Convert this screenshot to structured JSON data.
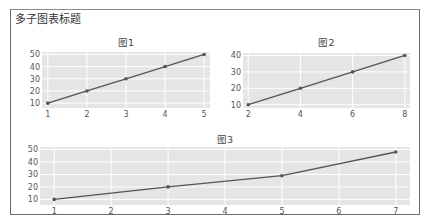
{
  "main_title": "多子图表标题",
  "colors": {
    "plot_bg": "#e5e5e5",
    "grid": "#ffffff",
    "line": "#555555",
    "marker": "#555555",
    "frame": "#6e6e6e"
  },
  "chart_data": [
    {
      "type": "line",
      "title": "图1",
      "x": [
        1,
        2,
        3,
        4,
        5
      ],
      "y": [
        10,
        20,
        30,
        40,
        50
      ],
      "xticks": [
        "1",
        "2",
        "3",
        "4",
        "5"
      ],
      "yticks": [
        "10",
        "20",
        "30",
        "40",
        "50"
      ],
      "xlabel": "",
      "ylabel": "",
      "grid": true,
      "markers": true
    },
    {
      "type": "line",
      "title": "图2",
      "x": [
        2,
        4,
        6,
        8
      ],
      "y": [
        10,
        20,
        30,
        40
      ],
      "xticks": [
        "2",
        "4",
        "6",
        "8"
      ],
      "yticks": [
        "10",
        "20",
        "30",
        "40"
      ],
      "xlabel": "",
      "ylabel": "",
      "grid": true,
      "markers": true
    },
    {
      "type": "line",
      "title": "图3",
      "x": [
        1,
        3,
        5,
        7
      ],
      "y": [
        10,
        20,
        29,
        48
      ],
      "xticks": [
        "1",
        "2",
        "3",
        "4",
        "5",
        "6",
        "7"
      ],
      "yticks": [
        "10",
        "20",
        "30",
        "40",
        "50"
      ],
      "xlabel": "",
      "ylabel": "",
      "grid": true,
      "markers": true
    }
  ]
}
